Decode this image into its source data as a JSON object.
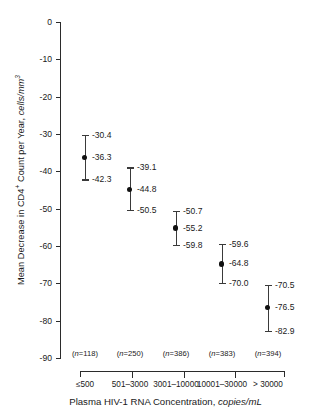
{
  "chart_data": {
    "type": "scatter",
    "title": "",
    "xlabel": "Plasma HIV-1 RNA Concentration, copies/mL",
    "xlabel_plain": "Plasma HIV-1 RNA Concentration, ",
    "xlabel_unit": "copies/mL",
    "ylabel_plain": "Mean Decrease in CD4",
    "ylabel_sup1": "+",
    "ylabel_mid": " Count per Year, ",
    "ylabel_unit": "cells/mm",
    "ylabel_sup2": "3",
    "ylim": [
      -90,
      0
    ],
    "ytick_labels": [
      "0",
      "-10",
      "-20",
      "-30",
      "-40",
      "-50",
      "-60",
      "-70",
      "-80",
      "-90"
    ],
    "ytick_values": [
      0,
      -10,
      -20,
      -30,
      -40,
      -50,
      -60,
      -70,
      -80,
      -90
    ],
    "grid": false,
    "legend": "none",
    "categories": [
      "≤500",
      "501–3000",
      "3001–10000",
      "10001–30000",
      "> 30000"
    ],
    "n_labels": [
      "(n=118)",
      "(n=250)",
      "(n=386)",
      "(n=383)",
      "(n=394)"
    ],
    "n_values": [
      118,
      250,
      386,
      383,
      394
    ],
    "values": [
      -36.3,
      -44.8,
      -55.2,
      -64.8,
      -76.5
    ],
    "ci_upper": [
      -30.4,
      -39.1,
      -50.7,
      -59.6,
      -70.5
    ],
    "ci_lower": [
      -42.3,
      -50.5,
      -59.8,
      -70.0,
      -82.9
    ],
    "point_labels": [
      "-36.3",
      "-44.8",
      "-55.2",
      "-64.8",
      "-76.5"
    ],
    "upper_labels": [
      "-30.4",
      "-39.1",
      "-50.7",
      "-59.6",
      "-70.5"
    ],
    "lower_labels": [
      "-42.3",
      "-50.5",
      "-59.8",
      "-70.0",
      "-82.9"
    ],
    "marker_color": "#111111",
    "errorbar_color": "#3a3a3a",
    "axis_color": "#2b2b2b",
    "background": "#ffffff"
  }
}
